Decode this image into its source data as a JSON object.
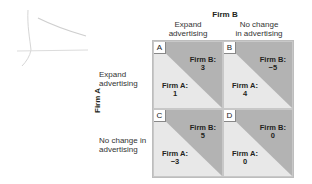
{
  "players": {
    "column": "Firm B",
    "row": "Firm A"
  },
  "columns": [
    {
      "line1": "Expand",
      "line2": "advertising"
    },
    {
      "line1": "No change",
      "line2": "in advertising"
    }
  ],
  "rows": [
    {
      "line1": "Expand",
      "line2": "advertising"
    },
    {
      "line1": "No change in",
      "line2": "advertising"
    }
  ],
  "cells": [
    {
      "letter": "A",
      "firm_b_label": "Firm B:",
      "firm_b_value": "3",
      "firm_a_label": "Firm A:",
      "firm_a_value": "1"
    },
    {
      "letter": "B",
      "firm_b_label": "Firm B:",
      "firm_b_value": "−5",
      "firm_a_label": "Firm A:",
      "firm_a_value": "4"
    },
    {
      "letter": "C",
      "firm_b_label": "Firm B:",
      "firm_b_value": "5",
      "firm_a_label": "Firm A:",
      "firm_a_value": "−3"
    },
    {
      "letter": "D",
      "firm_b_label": "Firm B:",
      "firm_b_value": "0",
      "firm_a_label": "Firm A:",
      "firm_a_value": "0"
    }
  ],
  "colors": {
    "firm_b_region": "#b3b3b3",
    "firm_a_region": "#e8e8e8",
    "border": "#c8c8c8"
  }
}
